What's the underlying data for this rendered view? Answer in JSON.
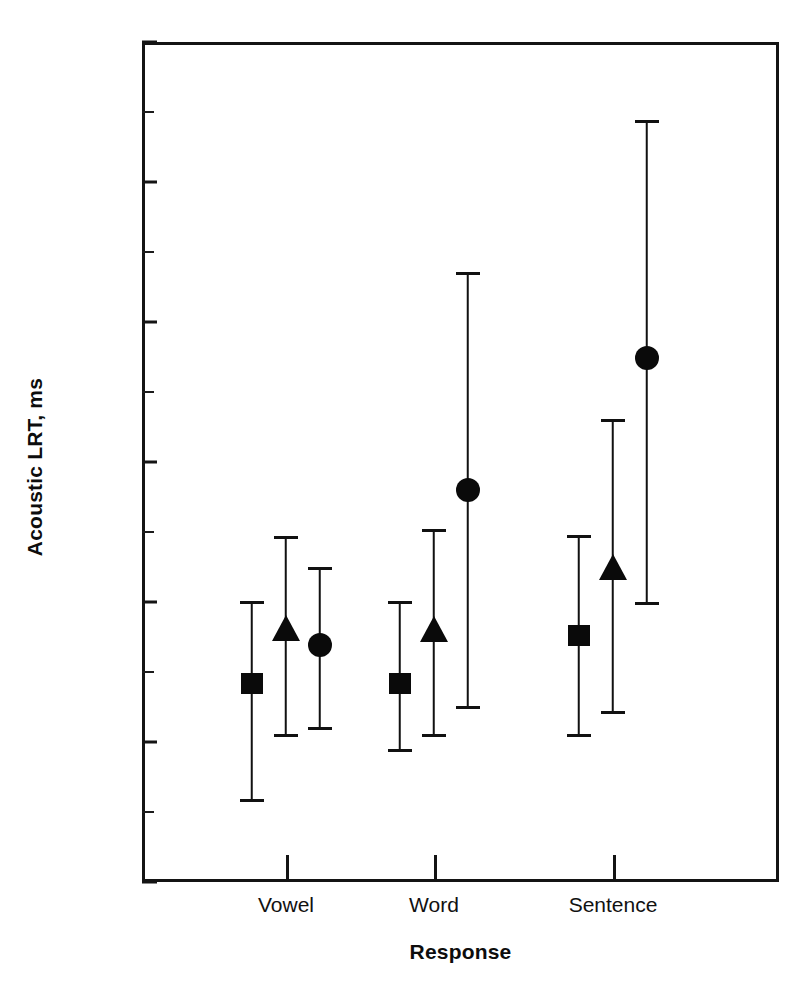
{
  "chart_data": {
    "type": "scatter",
    "title": "",
    "xlabel": "Response",
    "ylabel": "Acoustic LRT, ms",
    "categories": [
      "Vowel",
      "Word",
      "Sentence"
    ],
    "ylim": [
      200,
      800
    ],
    "ytick_labels": [
      "200",
      "300",
      "400",
      "500",
      "600",
      "700",
      "800"
    ],
    "ytick_values": [
      200,
      300,
      400,
      500,
      600,
      700,
      800
    ],
    "yminor_values": [
      250,
      350,
      450,
      550,
      650,
      750
    ],
    "grid": false,
    "legend": "none",
    "error_type": "error bars",
    "series": [
      {
        "name": "Square",
        "marker": "square",
        "values": [
          342,
          342,
          376
        ],
        "upper": [
          401,
          401,
          448
        ],
        "lower": [
          259,
          295,
          306
        ]
      },
      {
        "name": "Triangle",
        "marker": "triangle",
        "values": [
          381,
          380,
          424
        ],
        "upper": [
          447,
          452,
          531
        ],
        "lower": [
          306,
          306,
          322
        ]
      },
      {
        "name": "Circle",
        "marker": "circle",
        "values": [
          369,
          480,
          574
        ],
        "upper": [
          425,
          636,
          744
        ],
        "lower": [
          311,
          326,
          400
        ]
      }
    ]
  },
  "axis": {
    "y_title": "Acoustic LRT, ms",
    "x_title": "Response"
  },
  "colors": {
    "marker": "#0a0a0a",
    "axis": "#141414",
    "background": "#ffffff"
  }
}
